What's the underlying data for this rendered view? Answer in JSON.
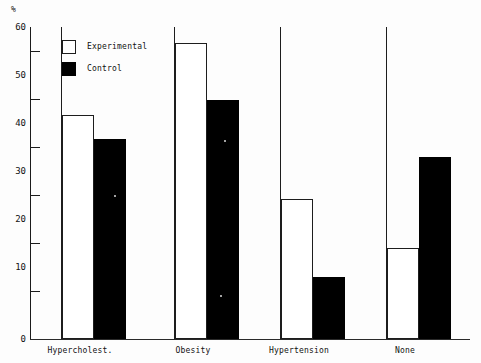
{
  "chart_data": {
    "type": "bar",
    "title": "",
    "subtitle": "",
    "xlabel": "",
    "ylabel": "%",
    "unit_symbol": "%",
    "categories": [
      "Hypercholest.",
      "Obesity",
      "Hypertension",
      "None"
    ],
    "series": [
      {
        "name": "Experimental",
        "color": "#ffffff",
        "values": [
          43,
          57,
          27,
          17.5
        ]
      },
      {
        "name": "Control",
        "color": "#000000",
        "values": [
          38.5,
          46,
          12,
          35
        ]
      }
    ],
    "ylim": [
      0,
      60
    ],
    "ytick_labels": [
      "60",
      "50",
      "40",
      "30",
      "20",
      "10",
      "0"
    ],
    "ytick_values": [
      60,
      50,
      40,
      30,
      20,
      10,
      0
    ],
    "grid": false,
    "legend_position": "top-left",
    "legend_entries": [
      "Experimental",
      "Control"
    ],
    "annotations": []
  },
  "axes": {
    "y_symbol": "%",
    "ticks": [
      {
        "label": "60",
        "value": 60
      },
      {
        "label": "50",
        "value": 50
      },
      {
        "label": "40",
        "value": 40
      },
      {
        "label": "30",
        "value": 30
      },
      {
        "label": "20",
        "value": 20
      },
      {
        "label": "10",
        "value": 10
      },
      {
        "label": "0",
        "value": 0
      }
    ]
  },
  "legend": {
    "items": [
      {
        "label": "Experimental",
        "swatch": "white-square"
      },
      {
        "label": "Control",
        "swatch": "black-square"
      }
    ]
  },
  "categories": [
    {
      "label": "Hypercholest."
    },
    {
      "label": "Obesity"
    },
    {
      "label": "Hypertension"
    },
    {
      "label": "None"
    }
  ]
}
